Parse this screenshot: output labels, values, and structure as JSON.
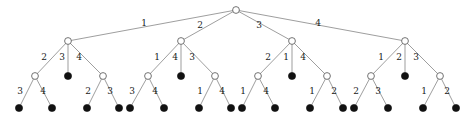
{
  "figure": {
    "type": "labelled-rooted-tree-diagram",
    "width": 473,
    "height": 119,
    "background": "#ffffff",
    "edge_color": "#8d8d8d",
    "internal_node_fill": "#ffffff",
    "internal_node_stroke": "#5a5a5a",
    "leaf_node_fill": "#111111",
    "label_color": "#1a1a1a",
    "internal_node_radius": 3.4,
    "leaf_node_radius": 3.6,
    "levels": 4,
    "root_edge_count": 4,
    "total_leaf_count": 20
  },
  "nodes": {
    "root": {
      "id": "r",
      "x": 236,
      "y": 10,
      "kind": "internal"
    },
    "level1": [
      {
        "id": "a",
        "x": 68,
        "y": 41,
        "kind": "internal"
      },
      {
        "id": "b",
        "x": 181,
        "y": 41,
        "kind": "internal"
      },
      {
        "id": "c",
        "x": 292,
        "y": 41,
        "kind": "internal"
      },
      {
        "id": "d",
        "x": 405,
        "y": 41,
        "kind": "internal"
      }
    ],
    "level2": [
      {
        "id": "a1",
        "x": 35,
        "y": 76,
        "kind": "internal",
        "parent": "a"
      },
      {
        "id": "a2",
        "x": 68,
        "y": 76,
        "kind": "leaf",
        "parent": "a"
      },
      {
        "id": "a3",
        "x": 103,
        "y": 76,
        "kind": "internal",
        "parent": "a"
      },
      {
        "id": "b1",
        "x": 148,
        "y": 76,
        "kind": "internal",
        "parent": "b"
      },
      {
        "id": "b2",
        "x": 181,
        "y": 76,
        "kind": "leaf",
        "parent": "b"
      },
      {
        "id": "b3",
        "x": 215,
        "y": 76,
        "kind": "internal",
        "parent": "b"
      },
      {
        "id": "c1",
        "x": 258,
        "y": 76,
        "kind": "internal",
        "parent": "c"
      },
      {
        "id": "c2",
        "x": 292,
        "y": 76,
        "kind": "leaf",
        "parent": "c"
      },
      {
        "id": "c3",
        "x": 327,
        "y": 76,
        "kind": "internal",
        "parent": "c"
      },
      {
        "id": "d1",
        "x": 371,
        "y": 76,
        "kind": "internal",
        "parent": "d"
      },
      {
        "id": "d2",
        "x": 405,
        "y": 76,
        "kind": "leaf",
        "parent": "d"
      },
      {
        "id": "d3",
        "x": 440,
        "y": 76,
        "kind": "internal",
        "parent": "d"
      }
    ],
    "level3": [
      {
        "id": "a1L",
        "x": 19,
        "y": 108,
        "kind": "leaf",
        "parent": "a1"
      },
      {
        "id": "a1R",
        "x": 52,
        "y": 108,
        "kind": "leaf",
        "parent": "a1"
      },
      {
        "id": "a3L",
        "x": 87,
        "y": 108,
        "kind": "leaf",
        "parent": "a3"
      },
      {
        "id": "a3R",
        "x": 119,
        "y": 108,
        "kind": "leaf",
        "parent": "a3"
      },
      {
        "id": "b1L",
        "x": 130,
        "y": 108,
        "kind": "leaf",
        "parent": "b1"
      },
      {
        "id": "b1R",
        "x": 164,
        "y": 108,
        "kind": "leaf",
        "parent": "b1"
      },
      {
        "id": "b3L",
        "x": 199,
        "y": 108,
        "kind": "leaf",
        "parent": "b3"
      },
      {
        "id": "b3R",
        "x": 231,
        "y": 108,
        "kind": "leaf",
        "parent": "b3"
      },
      {
        "id": "c1L",
        "x": 242,
        "y": 108,
        "kind": "leaf",
        "parent": "c1"
      },
      {
        "id": "c1R",
        "x": 275,
        "y": 108,
        "kind": "leaf",
        "parent": "c1"
      },
      {
        "id": "c3L",
        "x": 310,
        "y": 108,
        "kind": "leaf",
        "parent": "c3"
      },
      {
        "id": "c3R",
        "x": 343,
        "y": 108,
        "kind": "leaf",
        "parent": "c3"
      },
      {
        "id": "d1L",
        "x": 354,
        "y": 108,
        "kind": "leaf",
        "parent": "d1"
      },
      {
        "id": "d1R",
        "x": 388,
        "y": 108,
        "kind": "leaf",
        "parent": "d1"
      },
      {
        "id": "d3L",
        "x": 423,
        "y": 108,
        "kind": "leaf",
        "parent": "d3"
      },
      {
        "id": "d3R",
        "x": 456,
        "y": 108,
        "kind": "leaf",
        "parent": "d3"
      }
    ]
  },
  "edges": [
    {
      "id": "e-r-a",
      "from": "root",
      "to": "a",
      "label": "1",
      "lx": 144,
      "ly": 26
    },
    {
      "id": "e-r-b",
      "from": "root",
      "to": "b",
      "label": "2",
      "lx": 200,
      "ly": 28
    },
    {
      "id": "e-r-c",
      "from": "root",
      "to": "c",
      "label": "3",
      "lx": 259,
      "ly": 28
    },
    {
      "id": "e-r-d",
      "from": "root",
      "to": "d",
      "label": "4",
      "lx": 318,
      "ly": 26
    },
    {
      "id": "e-a-a1",
      "from": "a",
      "to": "a1",
      "label": "2",
      "lx": 44,
      "ly": 60
    },
    {
      "id": "e-a-a2",
      "from": "a",
      "to": "a2",
      "label": "3",
      "lx": 62,
      "ly": 60
    },
    {
      "id": "e-a-a3",
      "from": "a",
      "to": "a3",
      "label": "4",
      "lx": 79,
      "ly": 60
    },
    {
      "id": "e-b-b1",
      "from": "b",
      "to": "b1",
      "label": "1",
      "lx": 157,
      "ly": 60
    },
    {
      "id": "e-b-b2",
      "from": "b",
      "to": "b2",
      "label": "4",
      "lx": 175,
      "ly": 60
    },
    {
      "id": "e-b-b3",
      "from": "b",
      "to": "b3",
      "label": "3",
      "lx": 192,
      "ly": 60
    },
    {
      "id": "e-c-c1",
      "from": "c",
      "to": "c1",
      "label": "2",
      "lx": 268,
      "ly": 60
    },
    {
      "id": "e-c-c2",
      "from": "c",
      "to": "c2",
      "label": "1",
      "lx": 286,
      "ly": 60
    },
    {
      "id": "e-c-c3",
      "from": "c",
      "to": "c3",
      "label": "4",
      "lx": 303,
      "ly": 60
    },
    {
      "id": "e-d-d1",
      "from": "d",
      "to": "d1",
      "label": "1",
      "lx": 381,
      "ly": 60
    },
    {
      "id": "e-d-d2",
      "from": "d",
      "to": "d2",
      "label": "2",
      "lx": 399,
      "ly": 60
    },
    {
      "id": "e-d-d3",
      "from": "d",
      "to": "d3",
      "label": "3",
      "lx": 416,
      "ly": 60
    },
    {
      "id": "e-a1-L",
      "from": "a1",
      "to": "a1L",
      "label": "3",
      "lx": 20,
      "ly": 94
    },
    {
      "id": "e-a1-R",
      "from": "a1",
      "to": "a1R",
      "label": "4",
      "lx": 43,
      "ly": 94
    },
    {
      "id": "e-a3-L",
      "from": "a3",
      "to": "a3L",
      "label": "2",
      "lx": 88,
      "ly": 94
    },
    {
      "id": "e-a3-R",
      "from": "a3",
      "to": "a3R",
      "label": "3",
      "lx": 110,
      "ly": 94
    },
    {
      "id": "e-b1-L",
      "from": "b1",
      "to": "b1L",
      "label": "3",
      "lx": 132,
      "ly": 94
    },
    {
      "id": "e-b1-R",
      "from": "b1",
      "to": "b1R",
      "label": "4",
      "lx": 155,
      "ly": 94
    },
    {
      "id": "e-b3-L",
      "from": "b3",
      "to": "b3L",
      "label": "1",
      "lx": 200,
      "ly": 94
    },
    {
      "id": "e-b3-R",
      "from": "b3",
      "to": "b3R",
      "label": "4",
      "lx": 222,
      "ly": 94
    },
    {
      "id": "e-c1-L",
      "from": "c1",
      "to": "c1L",
      "label": "1",
      "lx": 243,
      "ly": 94
    },
    {
      "id": "e-c1-R",
      "from": "c1",
      "to": "c1R",
      "label": "4",
      "lx": 266,
      "ly": 94
    },
    {
      "id": "e-c3-L",
      "from": "c3",
      "to": "c3L",
      "label": "1",
      "lx": 312,
      "ly": 94
    },
    {
      "id": "e-c3-R",
      "from": "c3",
      "to": "c3R",
      "label": "2",
      "lx": 334,
      "ly": 94
    },
    {
      "id": "e-d1-L",
      "from": "d1",
      "to": "d1L",
      "label": "2",
      "lx": 356,
      "ly": 94
    },
    {
      "id": "e-d1-R",
      "from": "d1",
      "to": "d1R",
      "label": "3",
      "lx": 378,
      "ly": 94
    },
    {
      "id": "e-d3-L",
      "from": "d3",
      "to": "d3L",
      "label": "1",
      "lx": 424,
      "ly": 94
    },
    {
      "id": "e-d3-R",
      "from": "d3",
      "to": "d3R",
      "label": "2",
      "lx": 447,
      "ly": 94
    }
  ]
}
